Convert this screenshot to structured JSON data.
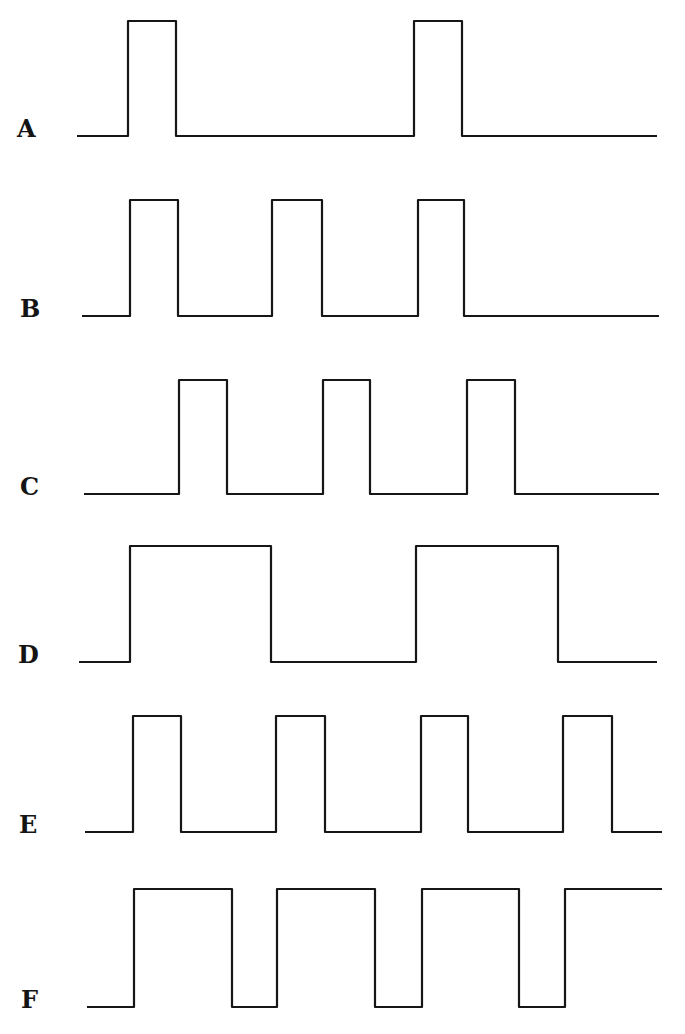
{
  "figure": {
    "line_color": "#161616",
    "background": "#ffffff"
  },
  "waveforms": [
    {
      "label": "A",
      "label_pos": [
        17,
        117
      ],
      "baseline_y": 136,
      "high_y": 21,
      "start_x": 77,
      "end_x": 657,
      "initial_state": "low",
      "transitions_x": [
        128,
        176,
        414,
        462
      ]
    },
    {
      "label": "B",
      "label_pos": [
        20,
        297
      ],
      "baseline_y": 316,
      "high_y": 200,
      "start_x": 82,
      "end_x": 659,
      "initial_state": "low",
      "transitions_x": [
        130,
        178,
        272,
        322,
        418,
        464
      ]
    },
    {
      "label": "C",
      "label_pos": [
        20,
        475
      ],
      "baseline_y": 494,
      "high_y": 380,
      "start_x": 84,
      "end_x": 659,
      "initial_state": "low",
      "transitions_x": [
        179,
        227,
        323,
        370,
        467,
        515
      ]
    },
    {
      "label": "D",
      "label_pos": [
        18,
        643
      ],
      "baseline_y": 662,
      "high_y": 546,
      "start_x": 79,
      "end_x": 657,
      "initial_state": "low",
      "transitions_x": [
        130,
        271,
        416,
        558
      ]
    },
    {
      "label": "E",
      "label_pos": [
        19,
        813
      ],
      "baseline_y": 832,
      "high_y": 716,
      "start_x": 85,
      "end_x": 662,
      "initial_state": "low",
      "transitions_x": [
        133,
        181,
        276,
        325,
        421,
        468,
        563,
        612
      ]
    },
    {
      "label": "F",
      "label_pos": [
        21,
        988
      ],
      "baseline_y": 1007,
      "high_y": 889,
      "start_x": 87,
      "end_x": 662,
      "initial_state": "low",
      "transitions_x": [
        134,
        232,
        277,
        375,
        422,
        519,
        565
      ]
    }
  ]
}
